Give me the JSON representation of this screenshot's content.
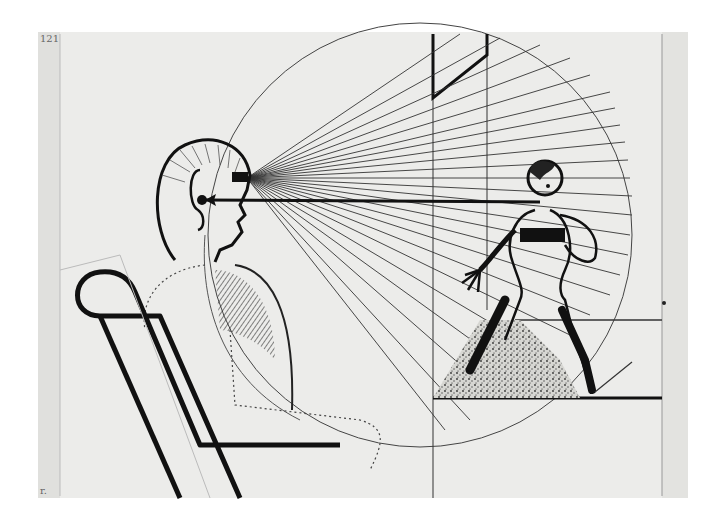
{
  "artwork": {
    "subject": "Seated figure in a chair looking at a standing figure, with radiating sightlines and a large circle",
    "medium": "ink drawing on paper",
    "corner_mark_top_left": "121",
    "corner_mark_bottom_left": "r.",
    "colors": {
      "paper": "#ececea",
      "paper_edge": "#dcdcda",
      "ink": "#111111",
      "fine_line": "#3a3a3a",
      "background": "#ffffff"
    }
  }
}
